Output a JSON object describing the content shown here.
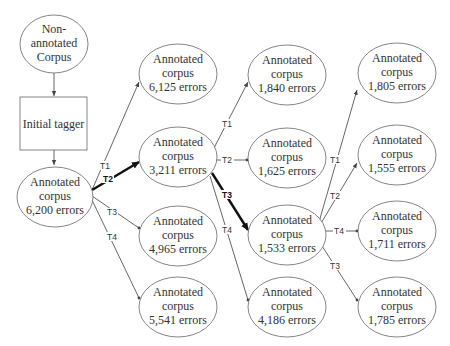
{
  "diagram": {
    "type": "tree",
    "nodes": {
      "source": {
        "lines": [
          "Non-",
          "annotated",
          "Corpus"
        ]
      },
      "tagger": {
        "lines": [
          "Initial tagger"
        ]
      },
      "root": {
        "lines": [
          "Annotated",
          "corpus",
          "6,200 errors"
        ]
      },
      "l1_t1": {
        "lines": [
          "Annotated",
          "corpus",
          "6,125 errors"
        ]
      },
      "l1_t2": {
        "lines": [
          "Annotated",
          "corpus",
          "3,211 errors"
        ]
      },
      "l1_t3": {
        "lines": [
          "Annotated",
          "corpus",
          "4,965 errors"
        ]
      },
      "l1_t4": {
        "lines": [
          "Annotated",
          "corpus",
          "5,541 errors"
        ]
      },
      "l2_t1": {
        "lines": [
          "Annotated",
          "corpus",
          "1,840 errors"
        ]
      },
      "l2_t2": {
        "lines": [
          "Annotated",
          "corpus",
          "1,625 errors"
        ]
      },
      "l2_t3": {
        "lines": [
          "Annotated",
          "corpus",
          "1,533 errors"
        ]
      },
      "l2_t4": {
        "lines": [
          "Annotated",
          "corpus",
          "4,186 errors"
        ]
      },
      "l3_t1": {
        "lines": [
          "Annotated",
          "corpus",
          "1,805 errors"
        ]
      },
      "l3_t2": {
        "lines": [
          "Annotated",
          "corpus",
          "1,555 errors"
        ]
      },
      "l3_t4": {
        "lines": [
          "Annotated",
          "corpus",
          "1,711 errors"
        ]
      },
      "l3_t3": {
        "lines": [
          "Annotated",
          "corpus",
          "1,785 errors"
        ]
      }
    },
    "edges": [
      {
        "from": "source",
        "to": "tagger",
        "label": ""
      },
      {
        "from": "tagger",
        "to": "root",
        "label": ""
      },
      {
        "from": "root",
        "to": "l1_t1",
        "label": "T1",
        "selected": false
      },
      {
        "from": "root",
        "to": "l1_t2",
        "label": "T2",
        "selected": true
      },
      {
        "from": "root",
        "to": "l1_t3",
        "label": "T3",
        "selected": false
      },
      {
        "from": "root",
        "to": "l1_t4",
        "label": "T4",
        "selected": false
      },
      {
        "from": "l1_t2",
        "to": "l2_t1",
        "label": "T1",
        "selected": false
      },
      {
        "from": "l1_t2",
        "to": "l2_t2",
        "label": "T2",
        "selected": false
      },
      {
        "from": "l1_t2",
        "to": "l2_t3",
        "label": "T3",
        "selected": true
      },
      {
        "from": "l1_t2",
        "to": "l2_t4",
        "label": "T4",
        "selected": false
      },
      {
        "from": "l2_t3",
        "to": "l3_t1",
        "label": "T1",
        "selected": false
      },
      {
        "from": "l2_t3",
        "to": "l3_t2",
        "label": "T2",
        "selected": false
      },
      {
        "from": "l2_t3",
        "to": "l3_t4",
        "label": "T4",
        "selected": false
      },
      {
        "from": "l2_t3",
        "to": "l3_t3",
        "label": "T3",
        "selected": false
      }
    ],
    "colors": {
      "stroke": "#555555",
      "text": "#333333",
      "selected_edge": "#111111",
      "background": "#ffffff"
    }
  }
}
